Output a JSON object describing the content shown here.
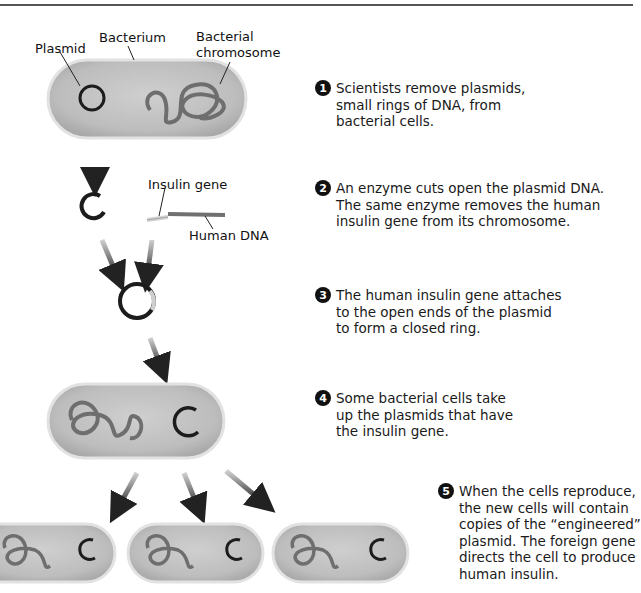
{
  "labels": {
    "plasmid": "Plasmid",
    "bacterium": "Bacterium",
    "bacterial_chromosome_line1": "Bacterial",
    "bacterial_chromosome_line2": "chromosome",
    "insulin_gene": "Insulin gene",
    "human_dna": "Human DNA"
  },
  "steps": [
    {
      "number": "1",
      "lines": [
        "Scientists remove plasmids,",
        "small rings of DNA, from",
        "bacterial cells."
      ]
    },
    {
      "number": "2",
      "lines": [
        "An enzyme cuts open the plasmid DNA.",
        "The same enzyme removes the human",
        "insulin gene from its chromosome."
      ]
    },
    {
      "number": "3",
      "lines": [
        "The human insulin gene attaches",
        "to the open ends of the plasmid",
        "to form a closed ring."
      ]
    },
    {
      "number": "4",
      "lines": [
        "Some bacterial cells take",
        "up the plasmids that have",
        "the insulin gene."
      ]
    },
    {
      "number": "5",
      "lines": [
        "When the cells reproduce,",
        "the new cells will contain",
        "copies of the “engineered”",
        "plasmid. The foreign gene",
        "directs the cell to produce",
        "human insulin."
      ]
    }
  ],
  "colors": {
    "cell_fill": "#c4c4c4",
    "cell_edge": "#d9d9d9",
    "chromosome": "#6e6e6e",
    "plasmid": "#1c1c1c",
    "insulin_gene": "#d0d0d0",
    "arrow": "#2a2a2a"
  }
}
